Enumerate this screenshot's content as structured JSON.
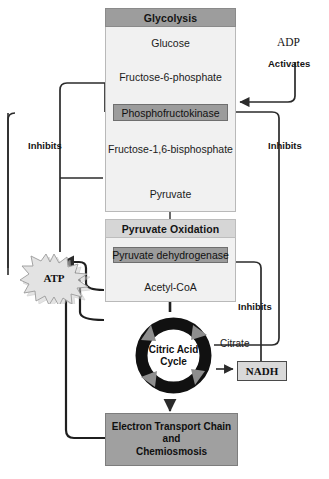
{
  "diagram": {
    "colors": {
      "panel_fill": "#f1f1f1",
      "panel_border": "#b9b9b9",
      "glycolysis_header_fill": "#9d9d9d",
      "pyruvate_oxidation_header_fill": "#d6d6d6",
      "enzyme_fill": "#9c9c9c",
      "etc_fill": "#a0a0a0",
      "nadh_fill": "#d9d9d9",
      "ring_color": "#111111",
      "ring_arrow_color": "#8e8e8e",
      "line_color": "#2b2b2b",
      "atp_burst_fill": "#cfcfcf"
    }
  },
  "glycolysis": {
    "header": "Glycolysis",
    "steps": [
      "Glucose",
      "Fructose-6-phosphate",
      "Fructose-1,6-bisphosphate",
      "Pyruvate"
    ],
    "enzyme": "Phosphofructokinase"
  },
  "pyruvate_oxidation": {
    "header": "Pyruvate Oxidation",
    "enzyme": "Pyruvate dehydrogenase",
    "product": "Acetyl-CoA"
  },
  "citric_acid_cycle": {
    "line1": "Citric Acid",
    "line2": "Cycle",
    "output_label": "Citrate"
  },
  "electron_transport": {
    "line1": "Electron Transport Chain",
    "line2": "and",
    "line3": "Chemiosmosis"
  },
  "molecules": {
    "atp": "ATP",
    "adp": "ADP",
    "nadh": "NADH"
  },
  "regulation": {
    "activates": "Activates",
    "inhibits_left": "Inhibits",
    "inhibits_right_upper": "Inhibits",
    "inhibits_right_lower": "Inhibits"
  }
}
